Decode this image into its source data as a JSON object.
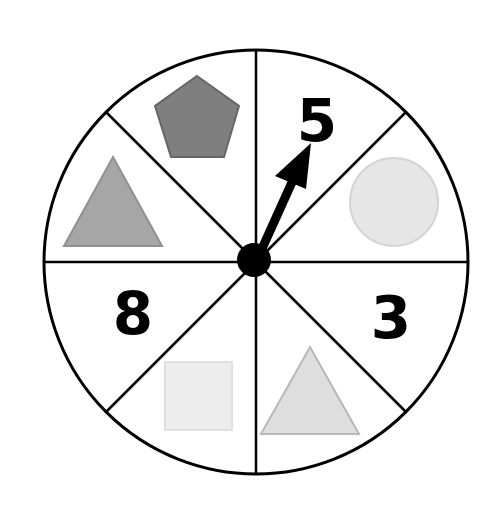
{
  "spinner": {
    "sections": [
      {
        "position": "top-left",
        "content": "pentagon",
        "color": "#7f7f7f"
      },
      {
        "position": "top-right",
        "content": "5"
      },
      {
        "position": "right-upper",
        "content": "circle",
        "color": "#e6e6e6"
      },
      {
        "position": "right-lower",
        "content": "3"
      },
      {
        "position": "bottom-right",
        "content": "triangle",
        "color": "#dedede"
      },
      {
        "position": "bottom-left",
        "content": "square",
        "color": "#ededed"
      },
      {
        "position": "left-lower",
        "content": "8"
      },
      {
        "position": "left-upper",
        "content": "triangle",
        "color": "#a6a6a6"
      }
    ],
    "labels": {
      "five": "5",
      "three": "3",
      "eight": "8"
    },
    "arrow_points_to": "5"
  }
}
